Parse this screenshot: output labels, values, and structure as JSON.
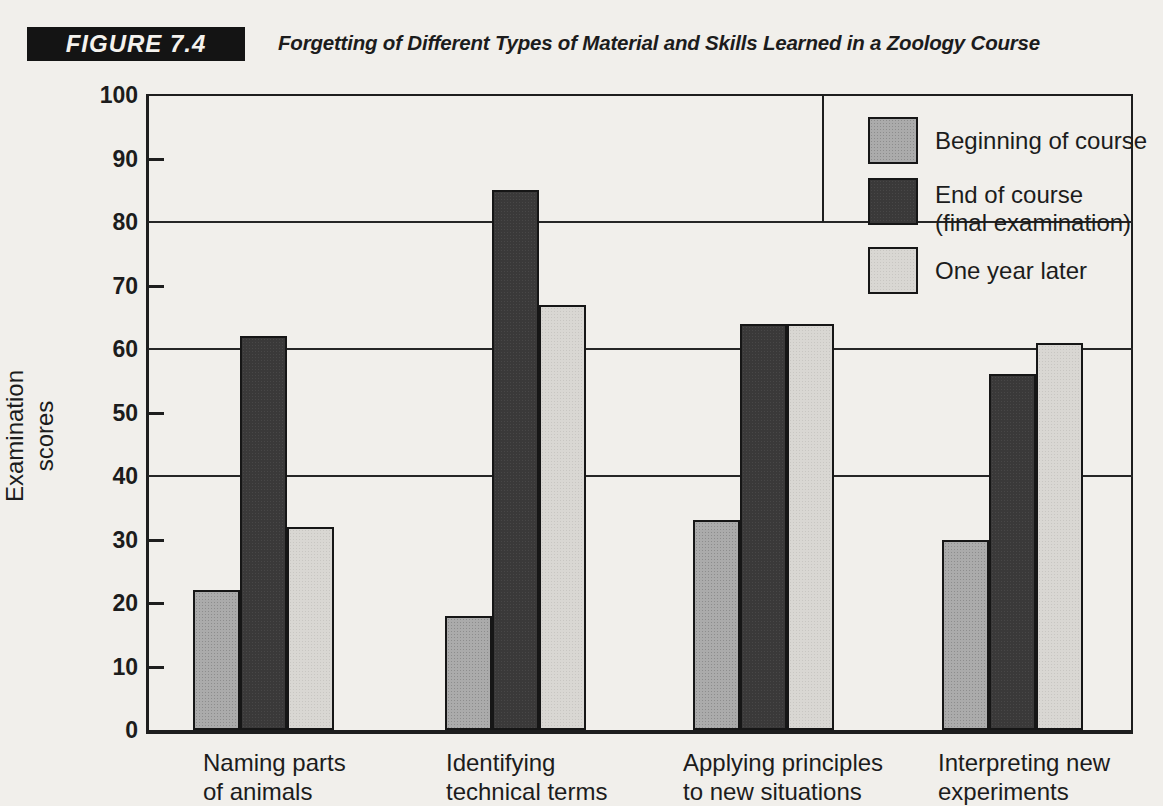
{
  "figure": {
    "tag": "FIGURE 7.4",
    "title": "Forgetting of Different Types of Material and Skills Learned in a Zoology Course"
  },
  "chart_data": {
    "type": "bar",
    "title": "Forgetting of Different Types of Material and Skills Learned in a Zoology Course",
    "xlabel": "",
    "ylabel": "Examination scores",
    "ylabel_lines": [
      "Examination",
      "scores"
    ],
    "ylim": [
      0,
      100
    ],
    "yticks": [
      0,
      10,
      20,
      30,
      40,
      50,
      60,
      70,
      80,
      90,
      100
    ],
    "gridline_values": [
      40,
      60,
      80
    ],
    "tick_dash_values": [
      10,
      20,
      30,
      50,
      70,
      90
    ],
    "grid": "horizontal lines at 40, 60, 80 only; plot fully framed",
    "legend_position": "upper right inside plot",
    "categories": [
      "Naming parts of animals",
      "Identifying technical terms",
      "Applying principles to new situations",
      "Interpreting new experiments"
    ],
    "category_label_lines": [
      [
        "Naming parts",
        "of animals"
      ],
      [
        "Identifying",
        "technical terms"
      ],
      [
        "Applying principles",
        "to new situations"
      ],
      [
        "Interpreting new",
        "experiments"
      ]
    ],
    "series": [
      {
        "name": "Beginning of course",
        "legend_lines": [
          "Beginning of course"
        ],
        "color": "#a6a6a6",
        "css_class": "tex-mid",
        "values": [
          22,
          18,
          33,
          30
        ]
      },
      {
        "name": "End of course (final examination)",
        "legend_lines": [
          "End of course",
          "(final examination)"
        ],
        "color": "#3d3c3c",
        "css_class": "tex-dark",
        "values": [
          62,
          85,
          64,
          56
        ]
      },
      {
        "name": "One year later",
        "legend_lines": [
          "One year later"
        ],
        "color": "#d7d5d1",
        "css_class": "tex-light",
        "values": [
          32,
          67,
          64,
          61
        ]
      }
    ]
  },
  "colors": {
    "paper": "#f1efeb",
    "ink": "#1c1c1c",
    "figure_tag_bg": "#141414",
    "figure_tag_text": "#f4f2ee"
  }
}
